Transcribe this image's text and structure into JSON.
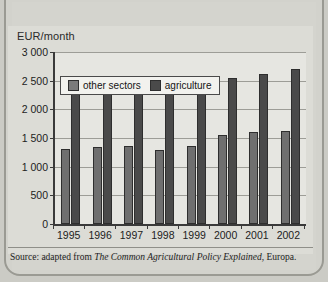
{
  "chart_data": {
    "type": "bar",
    "title": "",
    "xlabel": "",
    "ylabel": "EUR/month",
    "ylim": [
      0,
      3000
    ],
    "yticks": [
      "0",
      "500",
      "1 000",
      "1 500",
      "2 000",
      "2 500",
      "3 000"
    ],
    "ytick_values": [
      0,
      500,
      1000,
      1500,
      2000,
      2500,
      3000
    ],
    "grid": true,
    "legend_position": "top-left-inside",
    "categories": [
      "1995",
      "1996",
      "1997",
      "1998",
      "1999",
      "2000",
      "2001",
      "2002"
    ],
    "series": [
      {
        "name": "other sectors",
        "color": "#6f6f6f",
        "values": [
          1300,
          1350,
          1360,
          1290,
          1360,
          1550,
          1600,
          1620
        ]
      },
      {
        "name": "agriculture",
        "color": "#4a4a4a",
        "values": [
          2320,
          2320,
          2320,
          2380,
          2460,
          2540,
          2620,
          2710
        ]
      }
    ]
  },
  "axis": {
    "y_title": "EUR/month"
  },
  "legend": {
    "items": [
      {
        "label": "other sectors",
        "swatch": "#6f6f6f"
      },
      {
        "label": "agriculture",
        "swatch": "#4a4a4a"
      }
    ]
  },
  "footer": {
    "source_prefix": "Source: adapted from ",
    "source_title": "The Common Agricultural Policy Explained",
    "source_suffix": ", Europa."
  }
}
